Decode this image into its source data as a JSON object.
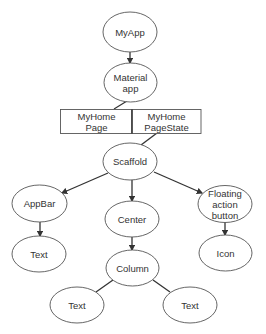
{
  "diagram": {
    "type": "widget-tree",
    "nodes": {
      "myapp": "MyApp",
      "material_app_l1": "Material",
      "material_app_l2": "app",
      "myhomepage_l1": "MyHome",
      "myhomepage_l2": "Page",
      "myhomepagestate_l1": "MyHome",
      "myhomepagestate_l2": "PageState",
      "scaffold": "Scaffold",
      "appbar": "AppBar",
      "appbar_text": "Text",
      "center": "Center",
      "column": "Column",
      "column_text_left": "Text",
      "column_text_right": "Text",
      "fab_l1": "Floating",
      "fab_l2": "action",
      "fab_l3": "button",
      "icon": "Icon"
    },
    "edges": [
      [
        "MyApp",
        "Material app"
      ],
      [
        "Material app",
        "MyHome Page"
      ],
      [
        "MyHome PageState",
        "Scaffold"
      ],
      [
        "Scaffold",
        "AppBar"
      ],
      [
        "Scaffold",
        "Center"
      ],
      [
        "Scaffold",
        "Floating action button"
      ],
      [
        "AppBar",
        "Text"
      ],
      [
        "Center",
        "Column"
      ],
      [
        "Column",
        "Text"
      ],
      [
        "Column",
        "Text"
      ],
      [
        "Floating action button",
        "Icon"
      ]
    ]
  }
}
